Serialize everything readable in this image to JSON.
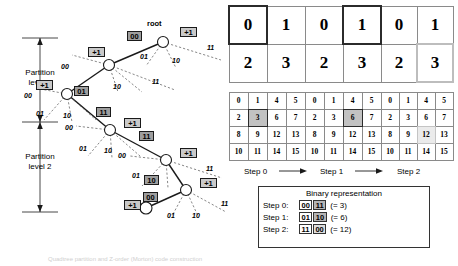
{
  "figure": {
    "title": "Quadtree partition and Z-order (Morton) code construction"
  },
  "tree": {
    "root_label": "root",
    "partition_levels": [
      {
        "line1": "Partition",
        "line2": "level 1"
      },
      {
        "line1": "Partition",
        "line2": "level 2"
      }
    ],
    "plus_badge": "+1",
    "nodes": [
      {
        "id": "root",
        "plus": "+1",
        "incoming_code": "00"
      },
      {
        "id": "n1",
        "plus": "+1",
        "incoming_code": "01"
      },
      {
        "id": "n2",
        "plus": "+1",
        "incoming_code": "11"
      },
      {
        "id": "n3",
        "plus": "+1",
        "incoming_code": "11"
      },
      {
        "id": "n4",
        "plus": "+1",
        "incoming_code": "10"
      },
      {
        "id": "n5",
        "plus": "+1",
        "incoming_code": "00"
      }
    ],
    "branch_codes": [
      "00",
      "01",
      "10",
      "11"
    ],
    "edge_labels": [
      {
        "text": "00"
      },
      {
        "text": "01"
      },
      {
        "text": "10"
      },
      {
        "text": "11"
      }
    ]
  },
  "grids": {
    "top_row": [
      {
        "step": "Step 0",
        "values": [
          [
            "0",
            "1"
          ],
          [
            "2",
            "3"
          ]
        ],
        "highlight": {
          "row": 0,
          "col": 0,
          "style": "dark"
        }
      },
      {
        "step": "Step 1",
        "values": [
          [
            "0",
            "1"
          ],
          [
            "2",
            "3"
          ]
        ],
        "highlight": {
          "row": 0,
          "col": 1,
          "style": "dark"
        }
      },
      {
        "step": "Step 2",
        "values": [
          [
            "0",
            "1"
          ],
          [
            "2",
            "3"
          ]
        ],
        "highlight": {
          "row": 1,
          "col": 1,
          "style": "light"
        }
      }
    ],
    "bottom_row": [
      {
        "step": "Step 0",
        "values": [
          [
            "0",
            "1",
            "4",
            "5"
          ],
          [
            "2",
            "3",
            "6",
            "7"
          ],
          [
            "8",
            "9",
            "12",
            "13"
          ],
          [
            "10",
            "11",
            "14",
            "15"
          ]
        ],
        "highlight": {
          "row": 1,
          "col": 1,
          "style": "dark"
        }
      },
      {
        "step": "Step 1",
        "values": [
          [
            "0",
            "1",
            "4",
            "5"
          ],
          [
            "2",
            "3",
            "6",
            "7"
          ],
          [
            "8",
            "9",
            "12",
            "13"
          ],
          [
            "10",
            "11",
            "14",
            "15"
          ]
        ],
        "highlight": {
          "row": 1,
          "col": 2,
          "style": "dark"
        }
      },
      {
        "step": "Step 2",
        "values": [
          [
            "0",
            "1",
            "4",
            "5"
          ],
          [
            "2",
            "3",
            "6",
            "7"
          ],
          [
            "8",
            "9",
            "12",
            "13"
          ],
          [
            "10",
            "11",
            "14",
            "15"
          ]
        ],
        "highlight": {
          "row": 2,
          "col": 2,
          "style": "light"
        }
      }
    ]
  },
  "steps": {
    "labels": [
      "Step 0",
      "Step 1",
      "Step 2"
    ],
    "arrow_glyph": "→"
  },
  "legend": {
    "title": "Binary representation",
    "rows": [
      {
        "name": "Step 0:",
        "high_bits": "00",
        "low_bits": "11",
        "low_shade": "dark",
        "result": "(= 3)"
      },
      {
        "name": "Step 1:",
        "high_bits": "01",
        "low_bits": "10",
        "low_shade": "dark",
        "result": "(= 6)"
      },
      {
        "name": "Step 2:",
        "high_bits": "11",
        "low_bits": "00",
        "low_shade": "light",
        "result": "(= 12)"
      }
    ]
  },
  "colors": {
    "badge_fill": "#c9c9c9",
    "code_fill": "#9e9e9e",
    "highlight_dark": "#c2c2c2",
    "highlight_light": "#ebebeb",
    "line": "#1a1a1a",
    "grid_line": "#8a8a8a"
  }
}
